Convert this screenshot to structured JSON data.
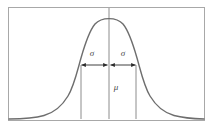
{
  "figure": {
    "frame": {
      "name": "plot-border",
      "x": 8,
      "y": 7,
      "width": 197,
      "height": 114,
      "stroke_color": "#a8a8a8",
      "stroke_width": 1,
      "fill": "#ffffff"
    },
    "curve": {
      "name": "bell-curve",
      "stroke_color": "#6e6e6e",
      "stroke_width": 1.4,
      "peak_x": 109,
      "peak_y": 19,
      "baseline_y": 119
    },
    "axis_colors": {
      "guide_line": "#8c8c8c",
      "arrow_line": "#2b2b2b",
      "text": "#4a4a4a"
    },
    "lines": [
      {
        "name": "mean-center-line",
        "x": 109,
        "y1": 8,
        "y2": 119
      },
      {
        "name": "minus-sigma-line",
        "x": 81,
        "y1": 65,
        "y2": 119
      },
      {
        "name": "plus-sigma-line",
        "x": 136,
        "y1": 65,
        "y2": 119
      }
    ],
    "arrows": [
      {
        "name": "left-sigma-arrow",
        "x1": 81,
        "x2": 108,
        "y": 65
      },
      {
        "name": "right-sigma-arrow",
        "x1": 110,
        "x2": 136,
        "y": 65
      }
    ],
    "labels": [
      {
        "name": "sigma-label-left",
        "text": "σ",
        "x": 92,
        "y": 54
      },
      {
        "name": "sigma-label-right",
        "text": "σ",
        "x": 123,
        "y": 54
      },
      {
        "name": "mu-label",
        "text": "μ",
        "x": 116,
        "y": 88
      }
    ]
  }
}
